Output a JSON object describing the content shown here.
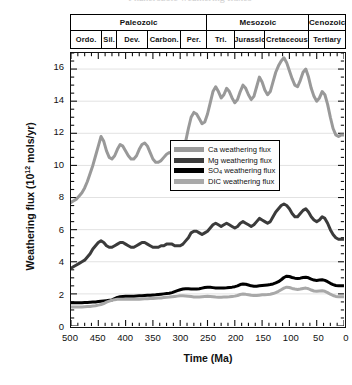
{
  "top_caption": "Phanerozoic weathering fluxes",
  "chart_data": {
    "type": "line",
    "title": "",
    "xlabel": "Time (Ma)",
    "ylabel": "Weathering flux (10^12 mols/yr)",
    "ylabel_base": "Weathering flux (10",
    "ylabel_exp": "12",
    "ylabel_tail": " mols/yr)",
    "xlim": [
      500,
      0
    ],
    "xlim_reversed": true,
    "ylim": [
      0,
      17
    ],
    "grid": true,
    "legend_position": "upper-center-right",
    "xticks": [
      500,
      450,
      400,
      350,
      300,
      250,
      200,
      150,
      100,
      50,
      0
    ],
    "xtick_labels": [
      "500",
      "450",
      "400",
      "350",
      "300",
      "250",
      "200",
      "150",
      "100",
      "50",
      "0"
    ],
    "yticks": [
      0,
      2,
      4,
      6,
      8,
      10,
      12,
      14,
      16
    ],
    "ytick_labels": [
      "0",
      "2",
      "4",
      "6",
      "8",
      "10",
      "12",
      "14",
      "16"
    ],
    "x": [
      500,
      495,
      490,
      485,
      480,
      475,
      470,
      465,
      460,
      455,
      450,
      445,
      440,
      435,
      430,
      425,
      420,
      415,
      410,
      405,
      400,
      395,
      390,
      385,
      380,
      375,
      370,
      365,
      360,
      355,
      350,
      345,
      340,
      335,
      330,
      325,
      320,
      315,
      310,
      305,
      300,
      295,
      290,
      285,
      280,
      275,
      270,
      265,
      260,
      255,
      250,
      245,
      240,
      235,
      230,
      225,
      220,
      215,
      210,
      205,
      200,
      195,
      190,
      185,
      180,
      175,
      170,
      165,
      160,
      155,
      150,
      145,
      140,
      135,
      130,
      125,
      120,
      115,
      110,
      105,
      100,
      95,
      90,
      85,
      80,
      75,
      70,
      65,
      60,
      55,
      50,
      45,
      40,
      35,
      30,
      25,
      20,
      15,
      10,
      5,
      0
    ],
    "series": [
      {
        "name": "Ca weathering flux",
        "label": "Ca weathering flux",
        "color": "#999999",
        "width": 3.0,
        "values": [
          7.7,
          7.8,
          7.9,
          8.1,
          8.3,
          8.6,
          9.0,
          9.5,
          10.0,
          10.6,
          11.2,
          11.8,
          11.5,
          10.9,
          10.5,
          10.4,
          10.6,
          11.0,
          11.3,
          11.2,
          10.9,
          10.6,
          10.4,
          10.4,
          10.6,
          11.0,
          11.3,
          11.4,
          11.2,
          10.8,
          10.4,
          10.2,
          10.2,
          10.3,
          10.5,
          10.7,
          10.8,
          10.7,
          10.5,
          10.4,
          10.5,
          10.9,
          11.5,
          12.3,
          13.0,
          13.3,
          13.2,
          12.9,
          12.6,
          12.7,
          13.2,
          13.9,
          14.6,
          14.9,
          14.6,
          14.2,
          14.4,
          14.8,
          14.6,
          14.2,
          13.9,
          14.1,
          14.6,
          15.0,
          14.8,
          14.4,
          14.1,
          14.3,
          14.9,
          15.5,
          15.2,
          14.7,
          14.4,
          14.6,
          15.2,
          15.8,
          16.2,
          16.5,
          16.7,
          16.4,
          15.9,
          15.4,
          15.0,
          14.9,
          15.3,
          15.8,
          16.0,
          15.5,
          14.8,
          14.3,
          14.0,
          14.2,
          14.6,
          14.4,
          13.8,
          13.0,
          12.3,
          11.9,
          11.8,
          11.9,
          11.9
        ]
      },
      {
        "name": "Mg weathering flux",
        "label": "Mg weathering flux",
        "color": "#3b3b3b",
        "width": 3.0,
        "values": [
          3.6,
          3.7,
          3.8,
          3.9,
          4.0,
          4.1,
          4.3,
          4.5,
          4.8,
          5.0,
          5.2,
          5.3,
          5.2,
          5.0,
          4.9,
          4.9,
          5.0,
          5.1,
          5.2,
          5.2,
          5.1,
          5.0,
          4.9,
          4.9,
          5.0,
          5.1,
          5.2,
          5.2,
          5.1,
          5.0,
          4.9,
          4.9,
          4.9,
          5.0,
          5.0,
          5.1,
          5.1,
          5.1,
          5.0,
          5.0,
          5.0,
          5.1,
          5.3,
          5.5,
          5.8,
          5.9,
          5.9,
          5.8,
          5.7,
          5.8,
          5.9,
          6.1,
          6.3,
          6.4,
          6.3,
          6.2,
          6.3,
          6.4,
          6.3,
          6.2,
          6.1,
          6.2,
          6.4,
          6.5,
          6.4,
          6.3,
          6.2,
          6.3,
          6.5,
          6.7,
          6.6,
          6.5,
          6.4,
          6.5,
          6.8,
          7.1,
          7.3,
          7.5,
          7.6,
          7.5,
          7.3,
          7.0,
          6.8,
          6.8,
          7.0,
          7.2,
          7.3,
          7.1,
          6.8,
          6.6,
          6.5,
          6.6,
          6.8,
          6.7,
          6.4,
          6.0,
          5.7,
          5.5,
          5.4,
          5.4,
          5.4
        ]
      },
      {
        "name": "SO4 weathering flux",
        "label_prefix": "SO",
        "label_sub": "4",
        "label_suffix": " weathering flux",
        "label": "SO4 weathering flux",
        "color": "#000000",
        "width": 3.0,
        "values": [
          1.45,
          1.45,
          1.45,
          1.45,
          1.45,
          1.46,
          1.47,
          1.48,
          1.49,
          1.5,
          1.52,
          1.54,
          1.56,
          1.58,
          1.6,
          1.62,
          1.7,
          1.78,
          1.82,
          1.84,
          1.85,
          1.85,
          1.86,
          1.86,
          1.87,
          1.88,
          1.89,
          1.9,
          1.91,
          1.92,
          1.93,
          1.94,
          1.96,
          1.98,
          2.0,
          2.02,
          2.04,
          2.08,
          2.14,
          2.2,
          2.26,
          2.3,
          2.32,
          2.32,
          2.31,
          2.3,
          2.3,
          2.32,
          2.36,
          2.4,
          2.42,
          2.41,
          2.39,
          2.37,
          2.36,
          2.36,
          2.37,
          2.38,
          2.4,
          2.42,
          2.45,
          2.5,
          2.58,
          2.62,
          2.6,
          2.55,
          2.5,
          2.48,
          2.48,
          2.5,
          2.52,
          2.54,
          2.56,
          2.58,
          2.62,
          2.68,
          2.76,
          2.88,
          3.02,
          3.1,
          3.08,
          3.02,
          2.98,
          2.96,
          2.98,
          3.02,
          3.04,
          3.0,
          2.92,
          2.86,
          2.84,
          2.86,
          2.88,
          2.84,
          2.76,
          2.66,
          2.58,
          2.52,
          2.5,
          2.5,
          2.5
        ]
      },
      {
        "name": "DIC weathering flux",
        "label": "DIC weathering flux",
        "color": "#a8a8a8",
        "width": 3.0,
        "values": [
          1.18,
          1.18,
          1.18,
          1.18,
          1.19,
          1.2,
          1.21,
          1.22,
          1.24,
          1.26,
          1.3,
          1.34,
          1.4,
          1.48,
          1.55,
          1.6,
          1.64,
          1.66,
          1.67,
          1.67,
          1.67,
          1.66,
          1.66,
          1.66,
          1.66,
          1.67,
          1.68,
          1.69,
          1.7,
          1.71,
          1.72,
          1.73,
          1.74,
          1.75,
          1.77,
          1.79,
          1.8,
          1.82,
          1.84,
          1.86,
          1.88,
          1.88,
          1.87,
          1.85,
          1.83,
          1.81,
          1.8,
          1.8,
          1.82,
          1.84,
          1.85,
          1.84,
          1.82,
          1.8,
          1.79,
          1.79,
          1.8,
          1.81,
          1.82,
          1.84,
          1.86,
          1.9,
          1.96,
          1.99,
          1.97,
          1.94,
          1.91,
          1.9,
          1.9,
          1.92,
          1.94,
          1.95,
          1.96,
          1.98,
          2.02,
          2.08,
          2.16,
          2.26,
          2.36,
          2.42,
          2.4,
          2.34,
          2.3,
          2.28,
          2.3,
          2.34,
          2.36,
          2.32,
          2.24,
          2.18,
          2.16,
          2.18,
          2.2,
          2.16,
          2.08,
          1.98,
          1.9,
          1.84,
          1.82,
          1.82,
          1.82
        ]
      }
    ]
  },
  "geo_scale": {
    "eras": [
      {
        "label": "Paleozoic",
        "start": 500,
        "end": 251
      },
      {
        "label": "Mesozoic",
        "start": 251,
        "end": 65
      },
      {
        "label": "Cenozoic",
        "start": 65,
        "end": 0
      }
    ],
    "periods": [
      {
        "label": "Ordo.",
        "start": 500,
        "end": 443
      },
      {
        "label": "Sil.",
        "start": 443,
        "end": 416
      },
      {
        "label": "Dev.",
        "start": 416,
        "end": 359
      },
      {
        "label": "Carbon.",
        "start": 359,
        "end": 299
      },
      {
        "label": "Per.",
        "start": 299,
        "end": 251
      },
      {
        "label": "Tri.",
        "start": 251,
        "end": 200
      },
      {
        "label": "Jurassic",
        "start": 200,
        "end": 145
      },
      {
        "label": "Cretaceous",
        "start": 145,
        "end": 65
      },
      {
        "label": "Tertiary",
        "start": 65,
        "end": 0
      }
    ]
  }
}
